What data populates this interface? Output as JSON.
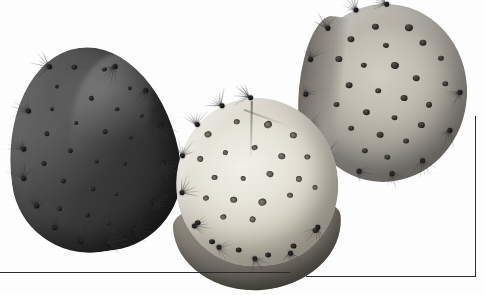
{
  "plate": {
    "name": "cactus-pads-plate",
    "description": "Grayscale photographic plate of three prickly pear (Opuntia) cactus pads on a white background",
    "background_color": "#ffffff",
    "rule_color": "#2a2a2a",
    "width": 484,
    "height": 295
  },
  "rules": [
    {
      "name": "bottom-rule-left",
      "orientation": "horizontal",
      "x": 0,
      "y": 272,
      "length": 290
    },
    {
      "name": "bottom-rule-right",
      "orientation": "horizontal",
      "x": 306,
      "y": 276,
      "length": 170
    },
    {
      "name": "right-rule",
      "orientation": "vertical",
      "x": 475,
      "y": 116,
      "length": 161
    }
  ],
  "specimens": [
    {
      "id": "pad-dark",
      "label": "dark teardrop cactus pad",
      "position": "left",
      "shape": "teardrop",
      "tone": "#3b3b3b",
      "tone_light": "#6e6e6e",
      "tone_dark": "#262626",
      "rotation_deg": -8,
      "areole_count": 22,
      "spine_tufts": 14
    },
    {
      "id": "pad-pale",
      "label": "pale cut cactus pad",
      "position": "center",
      "shape": "round",
      "tone": "#e8e5db",
      "tone_light": "#f2f0e9",
      "tone_dark": "#666158",
      "rotation_deg": -4,
      "areole_count": 20,
      "spine_tufts": 10
    },
    {
      "id": "pad-grey",
      "label": "grey round cactus pad",
      "position": "upper-right",
      "shape": "round",
      "tone": "#c3bfb4",
      "tone_light": "#d2cec4",
      "tone_dark": "#8d8982",
      "rotation_deg": 6,
      "areole_count": 24,
      "spine_tufts": 12
    }
  ]
}
